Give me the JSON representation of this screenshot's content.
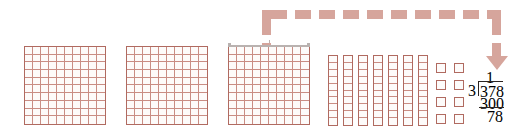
{
  "illustration": {
    "title": "Base-ten blocks model for long division 378 divided by 3",
    "colors": {
      "block_outline": "#b06a60",
      "block_grid_line": "#c98d84",
      "block_fill": "#fdfbfa",
      "arrow": "#d6a59c",
      "brace": "#b9b2b0",
      "text": "#2a2320",
      "background": "#ffffff"
    }
  },
  "blocks": {
    "hundreds_label": "hundreds-flat",
    "tens_label": "tens-rod",
    "ones_label": "ones-unit",
    "hundreds_count": 3,
    "tens_count": 7,
    "ones_count": 8,
    "flat_rows": 10,
    "flat_cols": 10,
    "rod_cells": 10,
    "total_value": 378,
    "hundreds": [
      {
        "index": 1,
        "value": 100,
        "x": 24,
        "y": 46,
        "w": 82,
        "h": 79,
        "braced": false
      },
      {
        "index": 2,
        "value": 100,
        "x": 126,
        "y": 46,
        "w": 82,
        "h": 79,
        "braced": false
      },
      {
        "index": 3,
        "value": 100,
        "x": 228,
        "y": 46,
        "w": 82,
        "h": 79,
        "braced": true
      }
    ],
    "tens": [
      {
        "index": 1,
        "value": 10,
        "x": 328,
        "y": 55,
        "w": 10,
        "h": 71
      },
      {
        "index": 2,
        "value": 10,
        "x": 343,
        "y": 55,
        "w": 10,
        "h": 71
      },
      {
        "index": 3,
        "value": 10,
        "x": 358,
        "y": 55,
        "w": 10,
        "h": 71
      },
      {
        "index": 4,
        "value": 10,
        "x": 373,
        "y": 55,
        "w": 10,
        "h": 71
      },
      {
        "index": 5,
        "value": 10,
        "x": 388,
        "y": 55,
        "w": 10,
        "h": 71
      },
      {
        "index": 6,
        "value": 10,
        "x": 403,
        "y": 55,
        "w": 10,
        "h": 71
      },
      {
        "index": 7,
        "value": 10,
        "x": 418,
        "y": 55,
        "w": 10,
        "h": 71
      }
    ],
    "ones": [
      {
        "index": 1,
        "value": 1,
        "x": 436,
        "y": 63
      },
      {
        "index": 2,
        "value": 1,
        "x": 454,
        "y": 63
      },
      {
        "index": 3,
        "value": 1,
        "x": 436,
        "y": 80
      },
      {
        "index": 4,
        "value": 1,
        "x": 454,
        "y": 80
      },
      {
        "index": 5,
        "value": 1,
        "x": 436,
        "y": 97
      },
      {
        "index": 6,
        "value": 1,
        "x": 454,
        "y": 97
      },
      {
        "index": 7,
        "value": 1,
        "x": 436,
        "y": 114
      },
      {
        "index": 8,
        "value": 1,
        "x": 454,
        "y": 114
      }
    ]
  },
  "brace": {
    "name": "group-brace-over-third-flat",
    "x": 228,
    "y": 45,
    "width": 82
  },
  "arrow": {
    "name": "dashed-flow-arrow",
    "description": "dashed arrow from the braced hundreds flat up and over to the long division problem",
    "start_x": 262,
    "start_y": 45,
    "top_y": 10,
    "end_x": 492,
    "head_y": 52
  },
  "division": {
    "name": "long-division-378-by-3",
    "quotient": "1",
    "divisor": "3",
    "dividend": "378",
    "subtrahend": "300",
    "remainder": "78",
    "operation": "378 ÷ 3"
  }
}
